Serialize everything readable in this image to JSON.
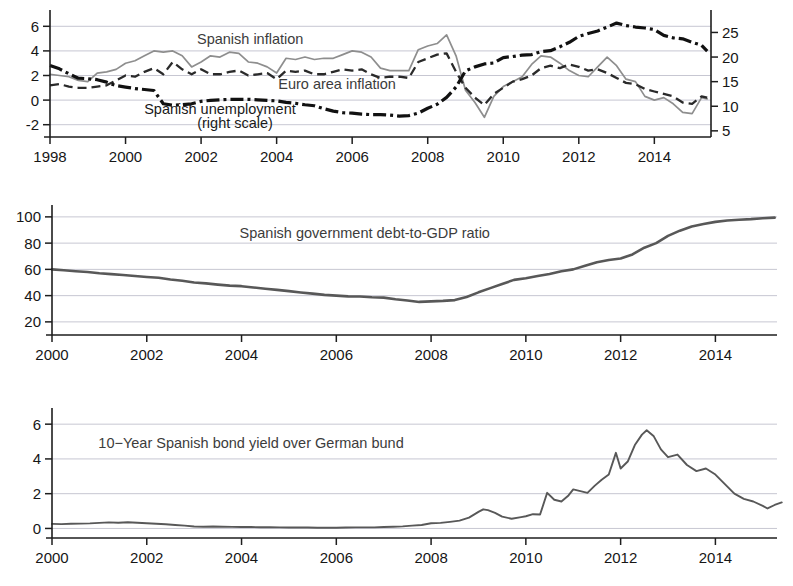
{
  "figure": {
    "title": "",
    "background": "#ffffff"
  },
  "chart_data": [
    {
      "id": "panel-inflation-unemployment",
      "type": "line",
      "title": "",
      "xlabel": "",
      "ylabel": "",
      "xlim": [
        1998.0,
        2015.5
      ],
      "ylim": [
        -3.0,
        7.0
      ],
      "y2lim": [
        3.75,
        28.75
      ],
      "grid": true,
      "legend_position": "inline-annotations",
      "xticks": [
        1998,
        2000,
        2002,
        2004,
        2006,
        2008,
        2010,
        2012,
        2014
      ],
      "xticklabels": [
        "1998",
        "2000",
        "2002",
        "2004",
        "2006",
        "2008",
        "2010",
        "2012",
        "2014"
      ],
      "yticks": [
        -2,
        0,
        2,
        4,
        6
      ],
      "yticklabels": [
        "-2",
        "0",
        "2",
        "4",
        "6"
      ],
      "y2ticks": [
        5,
        10,
        15,
        20,
        25
      ],
      "y2ticklabels": [
        "5",
        "10",
        "15",
        "20",
        "25"
      ],
      "annotations": [
        {
          "text": "Spanish inflation",
          "x": 2003.3,
          "y": 5.0,
          "color": "#8e8e8e"
        },
        {
          "text": "Euro area inflation",
          "x": 2005.6,
          "y": 1.3,
          "color": "#3c3c3c"
        },
        {
          "text": "Spanish unemployment",
          "x": 2002.5,
          "y": -0.75,
          "color": "#1a1a1a"
        },
        {
          "text": "(right scale)",
          "x": 2002.9,
          "y": -1.85,
          "color": "#1a1a1a"
        }
      ],
      "series": [
        {
          "name": "Spanish inflation",
          "axis": "left",
          "style": "solid",
          "color": "#8e8e8e",
          "x": [
            1998.0,
            1998.25,
            1998.5,
            1998.75,
            1999.0,
            1999.25,
            1999.5,
            1999.75,
            2000.0,
            2000.25,
            2000.5,
            2000.75,
            2001.0,
            2001.25,
            2001.5,
            2001.75,
            2002.0,
            2002.25,
            2002.5,
            2002.75,
            2003.0,
            2003.25,
            2003.5,
            2003.75,
            2004.0,
            2004.25,
            2004.5,
            2004.75,
            2005.0,
            2005.25,
            2005.5,
            2005.75,
            2006.0,
            2006.25,
            2006.5,
            2006.75,
            2007.0,
            2007.25,
            2007.5,
            2007.75,
            2008.0,
            2008.25,
            2008.5,
            2008.75,
            2009.0,
            2009.25,
            2009.5,
            2009.75,
            2010.0,
            2010.25,
            2010.5,
            2010.75,
            2011.0,
            2011.25,
            2011.5,
            2011.75,
            2012.0,
            2012.25,
            2012.5,
            2012.75,
            2013.0,
            2013.25,
            2013.5,
            2013.75,
            2014.0,
            2014.25,
            2014.5,
            2014.75,
            2015.0,
            2015.25,
            2015.4
          ],
          "values": [
            2.1,
            2.0,
            1.9,
            1.6,
            1.5,
            2.2,
            2.3,
            2.5,
            3.0,
            3.2,
            3.6,
            4.0,
            3.9,
            4.0,
            3.6,
            2.7,
            3.1,
            3.6,
            3.5,
            3.9,
            3.8,
            3.1,
            3.0,
            2.7,
            2.2,
            3.4,
            3.3,
            3.5,
            3.3,
            3.4,
            3.4,
            3.7,
            4.0,
            3.9,
            3.5,
            2.6,
            2.4,
            2.4,
            2.4,
            4.1,
            4.4,
            4.6,
            5.3,
            3.6,
            0.8,
            -0.2,
            -1.4,
            0.3,
            1.1,
            1.5,
            1.9,
            2.9,
            3.6,
            3.5,
            3.0,
            2.4,
            2.0,
            1.9,
            2.7,
            3.5,
            2.8,
            1.7,
            1.5,
            0.3,
            0.0,
            0.2,
            -0.3,
            -1.0,
            -1.1,
            0.2,
            0.1
          ]
        },
        {
          "name": "Euro area inflation",
          "axis": "left",
          "style": "dashed",
          "color": "#2a2a2a",
          "x": [
            1998.0,
            1998.25,
            1998.5,
            1998.75,
            1999.0,
            1999.25,
            1999.5,
            1999.75,
            2000.0,
            2000.25,
            2000.5,
            2000.75,
            2001.0,
            2001.25,
            2001.5,
            2001.75,
            2002.0,
            2002.25,
            2002.5,
            2002.75,
            2003.0,
            2003.25,
            2003.5,
            2003.75,
            2004.0,
            2004.25,
            2004.5,
            2004.75,
            2005.0,
            2005.25,
            2005.5,
            2005.75,
            2006.0,
            2006.25,
            2006.5,
            2006.75,
            2007.0,
            2007.25,
            2007.5,
            2007.75,
            2008.0,
            2008.25,
            2008.5,
            2008.75,
            2009.0,
            2009.25,
            2009.5,
            2009.75,
            2010.0,
            2010.25,
            2010.5,
            2010.75,
            2011.0,
            2011.25,
            2011.5,
            2011.75,
            2012.0,
            2012.25,
            2012.5,
            2012.75,
            2013.0,
            2013.25,
            2013.5,
            2013.75,
            2014.0,
            2014.25,
            2014.5,
            2014.75,
            2015.0,
            2015.25,
            2015.4
          ],
          "values": [
            1.2,
            1.3,
            1.1,
            1.0,
            1.0,
            1.1,
            1.2,
            1.6,
            2.0,
            1.9,
            2.3,
            2.6,
            2.1,
            3.1,
            2.5,
            2.1,
            2.5,
            2.1,
            2.1,
            2.3,
            2.4,
            2.0,
            2.1,
            2.2,
            1.7,
            2.4,
            2.3,
            2.4,
            2.1,
            2.1,
            2.3,
            2.5,
            2.4,
            2.5,
            2.1,
            1.8,
            1.9,
            1.9,
            1.8,
            3.1,
            3.4,
            3.7,
            3.8,
            2.3,
            1.0,
            0.2,
            -0.4,
            0.5,
            1.0,
            1.5,
            1.7,
            2.0,
            2.6,
            2.8,
            2.6,
            2.9,
            2.7,
            2.4,
            2.5,
            2.2,
            1.8,
            1.4,
            1.3,
            0.9,
            0.7,
            0.5,
            0.3,
            -0.2,
            -0.3,
            0.3,
            0.2
          ]
        },
        {
          "name": "Spanish unemployment",
          "axis": "right",
          "style": "dash-dot",
          "color": "#111111",
          "x": [
            1998.0,
            1998.25,
            1998.5,
            1998.75,
            1999.0,
            1999.25,
            1999.5,
            1999.75,
            2000.0,
            2000.25,
            2000.5,
            2000.75,
            2001.0,
            2001.25,
            2001.5,
            2001.75,
            2002.0,
            2002.25,
            2002.5,
            2002.75,
            2003.0,
            2003.25,
            2003.5,
            2003.75,
            2004.0,
            2004.25,
            2004.5,
            2004.75,
            2005.0,
            2005.25,
            2005.5,
            2005.75,
            2006.0,
            2006.25,
            2006.5,
            2006.75,
            2007.0,
            2007.25,
            2007.5,
            2007.75,
            2008.0,
            2008.25,
            2008.5,
            2008.75,
            2009.0,
            2009.25,
            2009.5,
            2009.75,
            2010.0,
            2010.25,
            2010.5,
            2010.75,
            2011.0,
            2011.25,
            2011.5,
            2011.75,
            2012.0,
            2012.25,
            2012.5,
            2012.75,
            2013.0,
            2013.25,
            2013.5,
            2013.75,
            2014.0,
            2014.25,
            2014.5,
            2014.75,
            2015.0,
            2015.25,
            2015.4
          ],
          "values": [
            18.3,
            17.6,
            16.6,
            15.7,
            15.6,
            15.4,
            14.9,
            14.2,
            13.9,
            13.6,
            13.4,
            13.2,
            10.5,
            10.2,
            10.3,
            10.5,
            11.0,
            11.2,
            11.3,
            11.4,
            11.4,
            11.4,
            11.3,
            11.2,
            11.1,
            10.8,
            10.6,
            10.3,
            10.1,
            9.5,
            9.0,
            8.7,
            8.6,
            8.4,
            8.3,
            8.3,
            8.2,
            8.0,
            8.1,
            8.6,
            9.6,
            10.4,
            11.8,
            13.9,
            17.2,
            18.0,
            18.6,
            18.8,
            19.9,
            20.1,
            20.4,
            20.5,
            21.1,
            21.3,
            22.1,
            23.0,
            24.2,
            24.8,
            25.3,
            26.1,
            26.9,
            26.4,
            26.1,
            25.9,
            25.6,
            24.4,
            23.9,
            23.7,
            23.0,
            22.4,
            21.2
          ]
        }
      ]
    },
    {
      "id": "panel-debt-to-gdp",
      "type": "line",
      "title": "Spanish government debt-to-GDP ratio",
      "xlabel": "",
      "ylabel": "",
      "xlim": [
        2000.0,
        2015.3
      ],
      "ylim": [
        10.0,
        106.0
      ],
      "grid": true,
      "legend_position": "inline-annotation",
      "xticks": [
        2000,
        2002,
        2004,
        2006,
        2008,
        2010,
        2012,
        2014
      ],
      "xticklabels": [
        "2000",
        "2002",
        "2004",
        "2006",
        "2008",
        "2010",
        "2012",
        "2014"
      ],
      "yticks": [
        20,
        40,
        60,
        80,
        100
      ],
      "yticklabels": [
        "20",
        "40",
        "60",
        "80",
        "100"
      ],
      "annotations": [
        {
          "text": "Spanish government debt-to-GDP ratio",
          "x": 2006.6,
          "y": 88.0,
          "color": "#3c3c3c"
        }
      ],
      "series": [
        {
          "name": "Spanish government debt-to-GDP ratio",
          "axis": "left",
          "style": "solid",
          "color": "#585858",
          "x": [
            2000.0,
            2000.25,
            2000.5,
            2000.75,
            2001.0,
            2001.25,
            2001.5,
            2001.75,
            2002.0,
            2002.25,
            2002.5,
            2002.75,
            2003.0,
            2003.25,
            2003.5,
            2003.75,
            2004.0,
            2004.25,
            2004.5,
            2004.75,
            2005.0,
            2005.25,
            2005.5,
            2005.75,
            2006.0,
            2006.25,
            2006.5,
            2006.75,
            2007.0,
            2007.25,
            2007.5,
            2007.75,
            2008.0,
            2008.25,
            2008.5,
            2008.75,
            2009.0,
            2009.25,
            2009.5,
            2009.75,
            2010.0,
            2010.25,
            2010.5,
            2010.75,
            2011.0,
            2011.25,
            2011.5,
            2011.75,
            2012.0,
            2012.25,
            2012.5,
            2012.75,
            2013.0,
            2013.25,
            2013.5,
            2013.75,
            2014.0,
            2014.25,
            2014.5,
            2014.75,
            2015.0,
            2015.25
          ],
          "values": [
            60.0,
            59.3,
            58.6,
            58.0,
            57.0,
            56.4,
            55.7,
            55.0,
            54.2,
            53.6,
            52.3,
            51.3,
            50.0,
            49.3,
            48.4,
            47.6,
            47.2,
            46.2,
            45.3,
            44.4,
            43.4,
            42.4,
            41.5,
            40.6,
            40.0,
            39.4,
            39.3,
            38.8,
            38.5,
            37.3,
            36.3,
            35.2,
            35.6,
            36.0,
            36.6,
            39.0,
            42.5,
            45.7,
            48.9,
            52.0,
            53.3,
            55.0,
            56.5,
            58.5,
            60.0,
            62.8,
            65.5,
            67.2,
            68.3,
            71.4,
            76.5,
            80.0,
            85.5,
            89.5,
            92.7,
            94.5,
            96.2,
            97.2,
            97.8,
            98.3,
            99.0,
            99.4
          ]
        }
      ]
    },
    {
      "id": "panel-bond-spread",
      "type": "line",
      "title": "10-Year Spanish bond yield over German bund",
      "xlabel": "",
      "ylabel": "",
      "xlim": [
        2000.0,
        2015.3
      ],
      "ylim": [
        -0.55,
        6.7
      ],
      "grid": true,
      "legend_position": "inline-annotation",
      "xticks": [
        2000,
        2002,
        2004,
        2006,
        2008,
        2010,
        2012,
        2014
      ],
      "xticklabels": [
        "2000",
        "2002",
        "2004",
        "2006",
        "2008",
        "2010",
        "2012",
        "2014"
      ],
      "yticks": [
        0,
        2,
        4,
        6
      ],
      "yticklabels": [
        "0",
        "2",
        "4",
        "6"
      ],
      "annotations": [
        {
          "text": "10−Year Spanish bond yield over German bund",
          "x": 2004.2,
          "y": 4.9,
          "color": "#3c3c3c"
        }
      ],
      "series": [
        {
          "name": "10-Year Spanish bond yield over German bund",
          "axis": "left",
          "style": "solid",
          "color": "#585858",
          "x": [
            2000.0,
            2000.2,
            2000.4,
            2000.6,
            2000.8,
            2001.0,
            2001.2,
            2001.4,
            2001.6,
            2001.8,
            2002.0,
            2002.2,
            2002.4,
            2002.6,
            2002.8,
            2003.0,
            2003.2,
            2003.4,
            2003.6,
            2003.8,
            2004.0,
            2004.2,
            2004.4,
            2004.6,
            2004.8,
            2005.0,
            2005.2,
            2005.4,
            2005.6,
            2005.8,
            2006.0,
            2006.2,
            2006.4,
            2006.6,
            2006.8,
            2007.0,
            2007.2,
            2007.4,
            2007.6,
            2007.8,
            2008.0,
            2008.2,
            2008.4,
            2008.6,
            2008.8,
            2009.0,
            2009.1,
            2009.2,
            2009.35,
            2009.5,
            2009.7,
            2009.9,
            2010.0,
            2010.15,
            2010.3,
            2010.45,
            2010.6,
            2010.75,
            2010.9,
            2011.0,
            2011.15,
            2011.3,
            2011.45,
            2011.6,
            2011.75,
            2011.9,
            2012.0,
            2012.15,
            2012.3,
            2012.45,
            2012.55,
            2012.7,
            2012.85,
            2013.0,
            2013.2,
            2013.4,
            2013.6,
            2013.8,
            2014.0,
            2014.2,
            2014.4,
            2014.6,
            2014.8,
            2015.0,
            2015.1,
            2015.25,
            2015.4
          ],
          "values": [
            0.26,
            0.25,
            0.27,
            0.28,
            0.29,
            0.32,
            0.35,
            0.33,
            0.36,
            0.33,
            0.3,
            0.27,
            0.24,
            0.2,
            0.16,
            0.11,
            0.1,
            0.11,
            0.1,
            0.09,
            0.08,
            0.08,
            0.07,
            0.07,
            0.06,
            0.05,
            0.05,
            0.05,
            0.04,
            0.04,
            0.04,
            0.05,
            0.06,
            0.06,
            0.06,
            0.08,
            0.1,
            0.12,
            0.16,
            0.2,
            0.3,
            0.32,
            0.38,
            0.45,
            0.62,
            0.95,
            1.1,
            1.05,
            0.9,
            0.68,
            0.56,
            0.65,
            0.7,
            0.82,
            0.8,
            2.05,
            1.65,
            1.55,
            1.9,
            2.25,
            2.15,
            2.05,
            2.45,
            2.8,
            3.1,
            4.35,
            3.45,
            3.85,
            4.8,
            5.4,
            5.65,
            5.3,
            4.55,
            4.1,
            4.25,
            3.65,
            3.3,
            3.45,
            3.1,
            2.55,
            2.0,
            1.7,
            1.55,
            1.3,
            1.15,
            1.35,
            1.5
          ]
        }
      ]
    }
  ]
}
